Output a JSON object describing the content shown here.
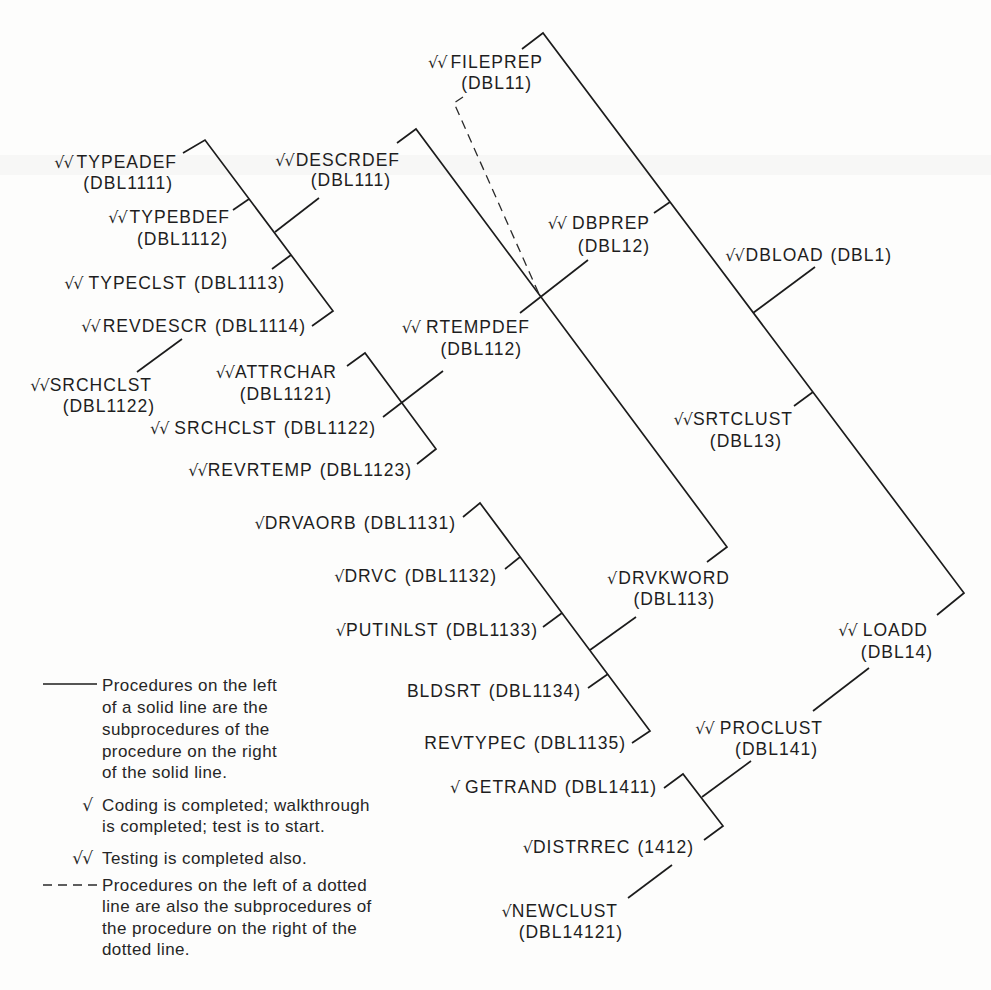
{
  "figure": {
    "nodes": {
      "dbload": {
        "status": "√√",
        "name": "DBLOAD",
        "code": "(DBL1)"
      },
      "fileprep": {
        "status": "√√",
        "name": "FILEPREP",
        "code": "(DBL11)"
      },
      "dbprep": {
        "status": "√√",
        "name": "DBPREP",
        "code": "(DBL12)"
      },
      "srtclust": {
        "status": "√√",
        "name": "SRTCLUST",
        "code": "(DBL13)"
      },
      "loadd": {
        "status": "√√",
        "name": "LOADD",
        "code": "(DBL14)"
      },
      "descrdef": {
        "status": "√√",
        "name": "DESCRDEF",
        "code": "(DBL111)"
      },
      "rtempdef": {
        "status": "√√",
        "name": "RTEMPDEF",
        "code": "(DBL112)"
      },
      "drvkword": {
        "status": "√",
        "name": "DRVKWORD",
        "code": "(DBL113)"
      },
      "typeadef": {
        "status": "√√",
        "name": "TYPEADEF",
        "code": "(DBL1111)"
      },
      "typebdef": {
        "status": "√√",
        "name": "TYPEBDEF",
        "code": "(DBL1112)"
      },
      "typeclst": {
        "status": "√√",
        "name": "TYPECLST",
        "code": "(DBL1113)"
      },
      "revdescr": {
        "status": "√√",
        "name": "REVDESCR",
        "code": "(DBL1114)"
      },
      "srchclst_a": {
        "status": "√√",
        "name": "SRCHCLST",
        "code": "(DBL1122)"
      },
      "attrchar": {
        "status": "√√",
        "name": "ATTRCHAR",
        "code": "(DBL1121)"
      },
      "srchclst_b": {
        "status": "√√",
        "name": "SRCHCLST",
        "code": "(DBL1122)"
      },
      "revrtemp": {
        "status": "√√",
        "name": "REVRTEMP",
        "code": "(DBL1123)"
      },
      "drvaorb": {
        "status": "√",
        "name": "DRVAORB",
        "code": "(DBL1131)"
      },
      "drvc": {
        "status": "√",
        "name": "DRVC",
        "code": "(DBL1132)"
      },
      "putinlst": {
        "status": "√",
        "name": "PUTINLST",
        "code": "(DBL1133)"
      },
      "bldsrt": {
        "status": "",
        "name": "BLDSRT",
        "code": "(DBL1134)"
      },
      "revtypec": {
        "status": "",
        "name": "REVTYPEC",
        "code": "(DBL1135)"
      },
      "proclust": {
        "status": "√√",
        "name": "PROCLUST",
        "code": "(DBL141)"
      },
      "getrand": {
        "status": "√",
        "name": "GETRAND",
        "code": "(DBL1411)"
      },
      "distrrec": {
        "status": "√",
        "name": "DISTRREC",
        "code": "(1412)"
      },
      "newclust": {
        "status": "√",
        "name": "NEWCLUST",
        "code": "(DBL14121)"
      }
    },
    "hierarchy": [
      {
        "parent": "DBLOAD",
        "link": "solid",
        "children": [
          "FILEPREP",
          "DBPREP",
          "SRTCLUST",
          "LOADD"
        ]
      },
      {
        "parent": "FILEPREP",
        "link": "solid",
        "children": [
          "DESCRDEF",
          "RTEMPDEF",
          "DRVKWORD"
        ]
      },
      {
        "parent": "DBPREP",
        "link": "dotted",
        "children": [
          "RTEMPDEF"
        ]
      },
      {
        "parent": "DESCRDEF",
        "link": "solid",
        "children": [
          "TYPEADEF",
          "TYPEBDEF",
          "TYPECLST",
          "REVDESCR"
        ]
      },
      {
        "parent": "REVDESCR",
        "link": "solid",
        "children": [
          "SRCHCLST"
        ]
      },
      {
        "parent": "RTEMPDEF",
        "link": "solid",
        "children": [
          "ATTRCHAR",
          "SRCHCLST",
          "REVRTEMP"
        ]
      },
      {
        "parent": "DRVKWORD",
        "link": "solid",
        "children": [
          "DRVAORB",
          "DRVC",
          "PUTINLST",
          "BLDSRT",
          "REVTYPEC"
        ]
      },
      {
        "parent": "LOADD",
        "link": "solid",
        "children": [
          "PROCLUST"
        ]
      },
      {
        "parent": "PROCLUST",
        "link": "solid",
        "children": [
          "GETRAND",
          "DISTRREC"
        ]
      },
      {
        "parent": "DISTRREC",
        "link": "solid",
        "children": [
          "NEWCLUST"
        ]
      }
    ],
    "legend": {
      "items": [
        {
          "symbol": "solid-line",
          "text_lines": [
            "Procedures on the left",
            "of a solid line are the",
            "subprocedures of the",
            "procedure on the right",
            "of the solid line."
          ]
        },
        {
          "symbol": "√",
          "text_lines": [
            "Coding is completed; walkthrough",
            "is completed; test is to start."
          ]
        },
        {
          "symbol": "√√",
          "text_lines": [
            "Testing is completed also."
          ]
        },
        {
          "symbol": "dashed-line",
          "text_lines": [
            "Procedures on the left of a dotted",
            "line are also the subprocedures of",
            "the procedure on the right of the",
            "dotted line."
          ]
        }
      ]
    }
  }
}
